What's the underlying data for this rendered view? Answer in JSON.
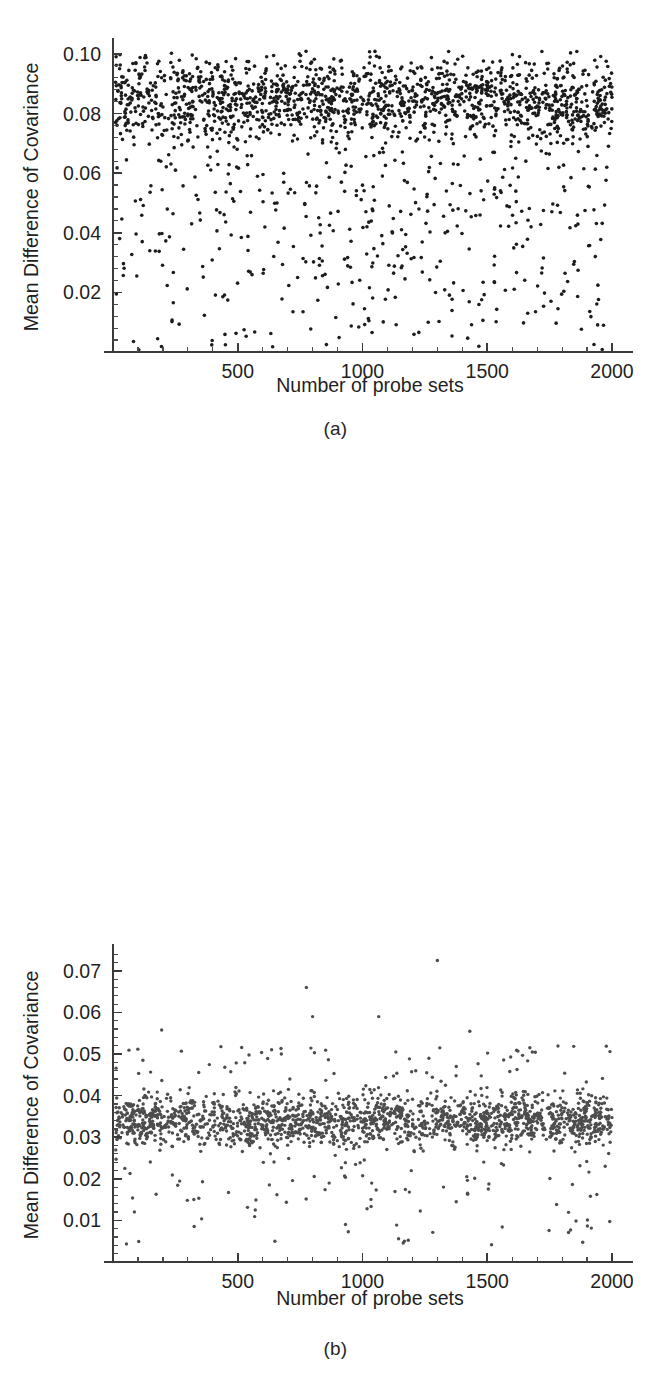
{
  "figure": {
    "background": "#ffffff",
    "panel_count": 3
  },
  "panels": [
    {
      "id": "a",
      "caption": "(a)",
      "xlabel": "Number of probe sets",
      "ylabel": "Mean Difference of Covariance",
      "xticks": [
        "500",
        "1000",
        "1500",
        "2000"
      ],
      "yticks": [
        "0.02",
        "0.04",
        "0.06",
        "0.08",
        "0.10"
      ],
      "dot_color": "#1c1c1c"
    },
    {
      "id": "b",
      "caption": "(b)",
      "xlabel": "Number of probe sets",
      "ylabel": "Mean Difference of Covariance",
      "xticks": [
        "500",
        "1000",
        "1500",
        "2000"
      ],
      "yticks": [
        "0.02",
        "0.04",
        "0.06",
        "0.08",
        "0.10"
      ],
      "dot_color": "#1c1c1c"
    },
    {
      "id": "c",
      "caption": "(c)",
      "xlabel": "Number of probe sets",
      "ylabel": "Mean Difference of Covariance",
      "xticks": [
        "500",
        "1000",
        "1500",
        "2000"
      ],
      "yticks": [
        "0.01",
        "0.02",
        "0.03",
        "0.04",
        "0.05",
        "0.06",
        "0.07"
      ],
      "dot_color": "#4d4d4d"
    }
  ],
  "chart_data": [
    {
      "type": "scatter",
      "panel": "a",
      "title": "",
      "xlabel": "Number of probe sets",
      "ylabel": "Mean Difference of Covariance",
      "xlim": [
        0,
        2060
      ],
      "ylim": [
        0,
        0.104
      ],
      "xticks": [
        500,
        1000,
        1500,
        2000
      ],
      "yticks": [
        0.02,
        0.04,
        0.06,
        0.08,
        0.1
      ],
      "xminor_per_major": 5,
      "yminor_per_major": 5,
      "grid": false,
      "legend": null,
      "n_points": 2000,
      "marker": "filled-circle",
      "marker_size_px": 3.6,
      "color": "#1c1c1c",
      "distribution": {
        "description": "Dense horizontal band of mean covariance differences with a long low tail",
        "main_band": {
          "fraction": 0.8,
          "center": 0.0845,
          "spread": 0.0072,
          "min": 0.066,
          "max": 0.101
        },
        "tail": {
          "fraction": 0.2,
          "min": 0.0005,
          "max": 0.066,
          "skew": "uniform-sparse"
        },
        "x_distribution": "uniform over [10, 2000]"
      },
      "seed": 11
    },
    {
      "type": "scatter",
      "panel": "b",
      "title": "",
      "xlabel": "Number of probe sets",
      "ylabel": "Mean Difference of Covariance",
      "xlim": [
        0,
        2060
      ],
      "ylim": [
        0,
        0.104
      ],
      "xticks": [
        500,
        1000,
        1500,
        2000
      ],
      "yticks": [
        0.02,
        0.04,
        0.06,
        0.08,
        0.1
      ],
      "xminor_per_major": 5,
      "yminor_per_major": 5,
      "grid": false,
      "legend": null,
      "n_points": 2000,
      "marker": "filled-circle",
      "marker_size_px": 3.6,
      "color": "#1c1c1c",
      "distribution": {
        "description": "Dense band centered near 0.048 with sparse low tail and a few high outliers",
        "main_band": {
          "fraction": 0.78,
          "center": 0.048,
          "spread": 0.0068,
          "min": 0.03,
          "max": 0.067
        },
        "tail": {
          "fraction": 0.215,
          "min": 0.0005,
          "max": 0.032,
          "skew": "uniform-sparse"
        },
        "outliers": [
          {
            "x": 790,
            "y": 0.0715
          },
          {
            "x": 1055,
            "y": 0.0915
          },
          {
            "x": 1190,
            "y": 0.08
          },
          {
            "x": 1205,
            "y": 0.0685
          },
          {
            "x": 1715,
            "y": 0.0965
          }
        ],
        "x_distribution": "uniform over [10, 2000]"
      },
      "seed": 29
    },
    {
      "type": "scatter",
      "panel": "c",
      "title": "",
      "xlabel": "Number of probe sets",
      "ylabel": "Mean Difference of Covariance",
      "xlim": [
        0,
        2060
      ],
      "ylim": [
        0,
        0.0755
      ],
      "xticks": [
        500,
        1000,
        1500,
        2000
      ],
      "yticks": [
        0.01,
        0.02,
        0.03,
        0.04,
        0.05,
        0.06,
        0.07
      ],
      "xminor_per_major": 5,
      "yminor_per_major": 5,
      "grid": false,
      "legend": null,
      "n_points": 2000,
      "marker": "filled-circle",
      "marker_size_px": 3.4,
      "color": "#4d4d4d",
      "distribution": {
        "description": "Very tight band around 0.034 with thin scatter above and below",
        "main_band": {
          "fraction": 0.87,
          "center": 0.034,
          "spread": 0.003,
          "min": 0.026,
          "max": 0.042
        },
        "tail": {
          "fraction": 0.125,
          "min": 0.003,
          "max": 0.052,
          "skew": "uniform-sparse"
        },
        "outliers": [
          {
            "x": 775,
            "y": 0.066
          },
          {
            "x": 1300,
            "y": 0.0725
          },
          {
            "x": 800,
            "y": 0.059
          },
          {
            "x": 1065,
            "y": 0.059
          },
          {
            "x": 1430,
            "y": 0.0555
          },
          {
            "x": 195,
            "y": 0.0558
          }
        ],
        "x_distribution": "uniform over [10, 2000]"
      },
      "seed": 47
    }
  ],
  "geometry": {
    "panels": [
      {
        "id": "a",
        "offset_y": 0,
        "plot_left": 113,
        "plot_right": 627,
        "plot_top": 42,
        "plot_bottom": 352,
        "xlabel_y": 392,
        "ylabel_cx": 38
      },
      {
        "id": "b",
        "offset_y": 460,
        "plot_left": 113,
        "plot_right": 627,
        "plot_top": 45,
        "plot_bottom": 365,
        "xlabel_y": 404,
        "ylabel_cx": 38
      },
      {
        "id": "c",
        "offset_y": 920,
        "plot_left": 113,
        "plot_right": 627,
        "plot_top": 948,
        "plot_bottom": 1262,
        "xlabel_y": 1305,
        "ylabel_cx": 38
      }
    ]
  }
}
